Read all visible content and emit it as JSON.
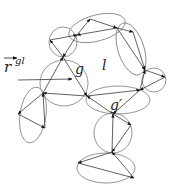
{
  "diagram": {
    "title": "",
    "labels": {
      "vector": "r",
      "vector_superscript": "gl",
      "group_g": "g",
      "region_l": "l",
      "group_g_prime": "g′"
    },
    "colors": {
      "ellipse": "#8a8a8a",
      "edge": "#3a3a3a",
      "arrowhead": "#111111",
      "text": "#222222"
    },
    "ellipses": [
      {
        "id": "top-left-circle",
        "cx": 63,
        "cy": 42,
        "rx": 14,
        "ry": 15,
        "rot": 0
      },
      {
        "id": "top-ellipse",
        "cx": 97,
        "cy": 28,
        "rx": 29,
        "ry": 13,
        "rot": -15
      },
      {
        "id": "right-ellipse",
        "cx": 131,
        "cy": 49,
        "rx": 13,
        "ry": 27,
        "rot": -18
      },
      {
        "id": "g-circle",
        "cx": 64,
        "cy": 83,
        "rx": 24,
        "ry": 23,
        "rot": 0
      },
      {
        "id": "right-circle",
        "cx": 154,
        "cy": 80,
        "rx": 12,
        "ry": 12,
        "rot": 0
      },
      {
        "id": "middle-ellipse",
        "cx": 118,
        "cy": 100,
        "rx": 32,
        "ry": 14,
        "rot": 0
      },
      {
        "id": "left-ellipse",
        "cx": 33,
        "cy": 115,
        "rx": 13,
        "ry": 28,
        "rot": 8
      },
      {
        "id": "lower-circle",
        "cx": 113,
        "cy": 133,
        "rx": 19,
        "ry": 20,
        "rot": 0
      },
      {
        "id": "bottom-ellipse",
        "cx": 106,
        "cy": 168,
        "rx": 29,
        "ry": 15,
        "rot": 0
      }
    ],
    "nodes": {
      "A": [
        50,
        40
      ],
      "B": [
        63,
        57
      ],
      "C": [
        77,
        35
      ],
      "E": [
        90,
        19
      ],
      "D": [
        117,
        28
      ],
      "F": [
        133,
        32
      ],
      "G": [
        145,
        70
      ],
      "H": [
        165,
        77
      ],
      "I": [
        140,
        90
      ],
      "J": [
        87,
        96
      ],
      "K": [
        43,
        93
      ],
      "L": [
        18,
        114
      ],
      "M": [
        45,
        128
      ],
      "N": [
        113,
        114
      ],
      "O": [
        131,
        125
      ],
      "P": [
        112,
        152
      ],
      "Q": [
        78,
        163
      ],
      "R": [
        134,
        178
      ]
    },
    "edges": [
      [
        "B",
        "A"
      ],
      [
        "A",
        "C"
      ],
      [
        "C",
        "B"
      ],
      [
        "C",
        "E"
      ],
      [
        "E",
        "D"
      ],
      [
        "D",
        "C"
      ],
      [
        "D",
        "F"
      ],
      [
        "F",
        "G"
      ],
      [
        "D",
        "G"
      ],
      [
        "G",
        "H"
      ],
      [
        "H",
        "I"
      ],
      [
        "I",
        "G"
      ],
      [
        "B",
        "J"
      ],
      [
        "J",
        "K"
      ],
      [
        "K",
        "B"
      ],
      [
        "J",
        "I"
      ],
      [
        "I",
        "N"
      ],
      [
        "N",
        "J"
      ],
      [
        "K",
        "L"
      ],
      [
        "L",
        "M"
      ],
      [
        "M",
        "K"
      ],
      [
        "N",
        "O"
      ],
      [
        "O",
        "P"
      ],
      [
        "P",
        "N"
      ],
      [
        "P",
        "Q"
      ],
      [
        "Q",
        "R"
      ],
      [
        "R",
        "P"
      ]
    ],
    "vector_arrow": {
      "from": [
        18,
        110
      ],
      "to": [
        72,
        79
      ]
    },
    "overbar": {
      "from": [
        4,
        58
      ],
      "to": [
        17,
        58
      ]
    }
  }
}
